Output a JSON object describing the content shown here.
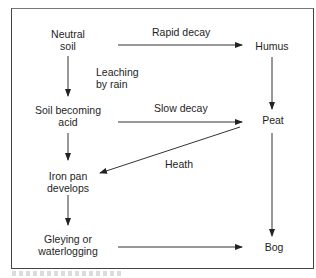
{
  "diagram": {
    "nodes": {
      "neutral_soil": [
        "Neutral",
        "soil"
      ],
      "humus": [
        "Humus"
      ],
      "soil_acid": [
        "Soil becoming",
        "acid"
      ],
      "peat": [
        "Peat"
      ],
      "iron_pan": [
        "Iron pan",
        "develops"
      ],
      "gleying": [
        "Gleying or",
        "waterlogging"
      ],
      "bog": [
        "Bog"
      ]
    },
    "edge_labels": {
      "rapid_decay": "Rapid decay",
      "leaching": [
        "Leaching",
        "by rain"
      ],
      "slow_decay": "Slow decay",
      "heath": "Heath"
    },
    "edges": [
      {
        "from": "Neutral soil",
        "to": "Humus",
        "label": "Rapid decay"
      },
      {
        "from": "Neutral soil",
        "to": "Soil becoming acid",
        "label": "Leaching by rain"
      },
      {
        "from": "Humus",
        "to": "Peat",
        "label": ""
      },
      {
        "from": "Soil becoming acid",
        "to": "Peat",
        "label": "Slow decay"
      },
      {
        "from": "Soil becoming acid",
        "to": "Iron pan develops",
        "label": ""
      },
      {
        "from": "Peat",
        "to": "Iron pan develops",
        "label": "Heath"
      },
      {
        "from": "Peat",
        "to": "Bog",
        "label": ""
      },
      {
        "from": "Iron pan develops",
        "to": "Gleying or waterlogging",
        "label": ""
      },
      {
        "from": "Gleying or waterlogging",
        "to": "Bog",
        "label": ""
      }
    ]
  }
}
